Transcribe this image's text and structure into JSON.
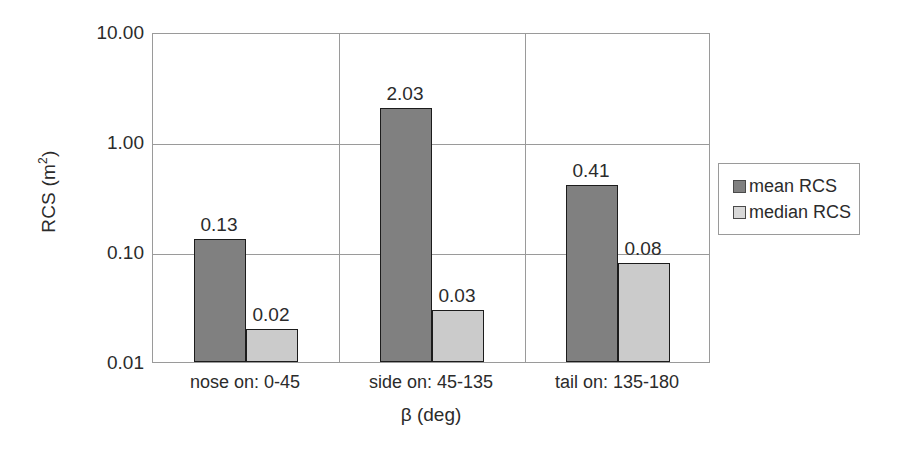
{
  "chart_data": {
    "type": "bar",
    "title": "",
    "xlabel": "β (deg)",
    "ylabel": "RCS (m²)",
    "ylabel_base": "RCS (m",
    "ylabel_exp": "2",
    "ylabel_close": ")",
    "yscale": "log",
    "ylim": [
      0.01,
      10.0
    ],
    "yticks": [
      "10.00",
      "1.00",
      "0.10",
      "0.01"
    ],
    "ytick_values": [
      10.0,
      1.0,
      0.1,
      0.01
    ],
    "grid": true,
    "legend_position": "right",
    "categories": [
      "nose on:  0-45",
      "side on: 45-135",
      "tail on: 135-180"
    ],
    "series": [
      {
        "name": "mean RCS",
        "color": "#808080",
        "values": [
          0.13,
          2.03,
          0.41
        ],
        "labels": [
          "0.13",
          "2.03",
          "0.41"
        ]
      },
      {
        "name": "median RCS",
        "color": "#cbcbcb",
        "values": [
          0.02,
          0.03,
          0.08
        ],
        "labels": [
          "0.02",
          "0.03",
          "0.08"
        ]
      }
    ]
  },
  "legend": {
    "items": [
      {
        "label": "mean RCS",
        "swatch": "mean"
      },
      {
        "label": "median RCS",
        "swatch": "median"
      }
    ]
  }
}
